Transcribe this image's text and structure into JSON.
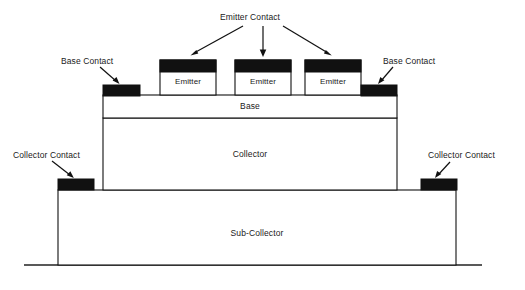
{
  "diagram": {
    "type": "semiconductor-cross-section",
    "background_color": "#ffffff",
    "line_color": "#111111",
    "contact_fill_color": "#111111",
    "layer_fill_color": "#ffffff"
  },
  "callouts": {
    "emitter_contact": "Emitter Contact",
    "base_contact_left": "Base Contact",
    "base_contact_right": "Base Contact",
    "collector_contact_left": "Collector Contact",
    "collector_contact_right": "Collector Contact"
  },
  "layers": {
    "base": "Base",
    "collector": "Collector",
    "sub_collector": "Sub-Collector"
  },
  "emitters": [
    {
      "label": "Emitter"
    },
    {
      "label": "Emitter"
    },
    {
      "label": "Emitter"
    }
  ]
}
